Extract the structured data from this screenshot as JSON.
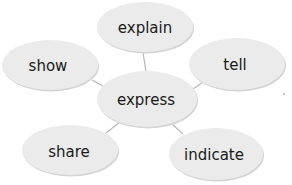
{
  "diagram": {
    "type": "word-web",
    "center": {
      "id": "express",
      "label": "express",
      "cx": 147,
      "cy": 99,
      "rx": 50,
      "ry": 28
    },
    "nodes": [
      {
        "id": "explain",
        "label": "explain",
        "cx": 145,
        "cy": 27,
        "rx": 48,
        "ry": 25
      },
      {
        "id": "show",
        "label": "show",
        "cx": 50,
        "cy": 65,
        "rx": 48,
        "ry": 25
      },
      {
        "id": "tell",
        "label": "tell",
        "cx": 237,
        "cy": 64,
        "rx": 48,
        "ry": 26
      },
      {
        "id": "share",
        "label": "share",
        "cx": 70,
        "cy": 150,
        "rx": 48,
        "ry": 25
      },
      {
        "id": "indicate",
        "label": "indicate",
        "cx": 216,
        "cy": 154,
        "rx": 47,
        "ry": 26
      }
    ],
    "edges": [
      [
        "express",
        "explain"
      ],
      [
        "express",
        "show"
      ],
      [
        "express",
        "tell"
      ],
      [
        "express",
        "share"
      ],
      [
        "express",
        "indicate"
      ]
    ],
    "colors": {
      "bubble": "#ebebeb",
      "connector": "#b8b8b8",
      "text": "#1a1a1a"
    }
  }
}
